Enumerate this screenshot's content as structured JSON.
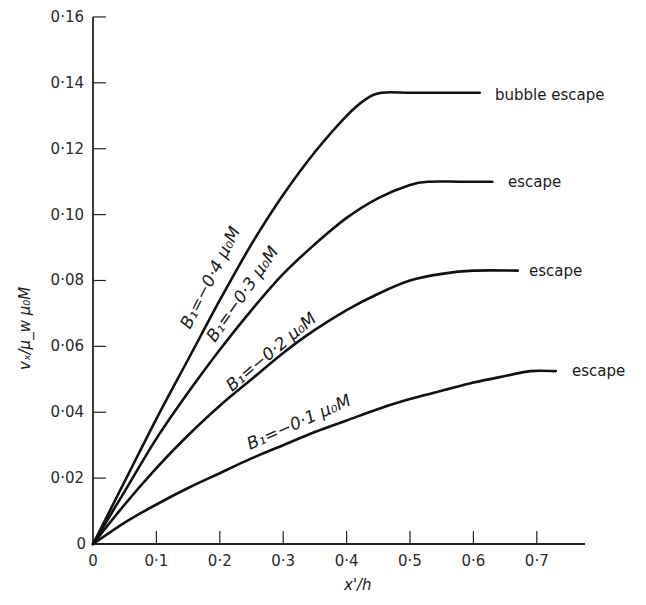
{
  "chart_data": {
    "type": "line",
    "title": "",
    "xlabel": "x'/h",
    "ylabel": "v_x / μ_w μ_0 M",
    "xlim": [
      0,
      0.75
    ],
    "ylim": [
      0,
      0.16
    ],
    "grid": false,
    "legend": "inline labels along curves",
    "x_ticks": [
      "0",
      "0·1",
      "0·2",
      "0·3",
      "0·4",
      "0·5",
      "0·6",
      "0·7"
    ],
    "x_tick_values": [
      0,
      0.1,
      0.2,
      0.3,
      0.4,
      0.5,
      0.6,
      0.7
    ],
    "y_ticks": [
      "0",
      "0·02",
      "0·04",
      "0·06",
      "0·08",
      "0·10",
      "0·12",
      "0·14",
      "0·16"
    ],
    "y_tick_values": [
      0,
      0.02,
      0.04,
      0.06,
      0.08,
      0.1,
      0.12,
      0.14,
      0.16
    ],
    "series": [
      {
        "name": "B1 = -0.4 μ0 M",
        "label": "B₁=−0·4 μ₀M",
        "end_label": "bubble escape",
        "x": [
          0,
          0.05,
          0.1,
          0.15,
          0.2,
          0.25,
          0.3,
          0.35,
          0.4,
          0.43,
          0.455,
          0.5,
          0.55,
          0.61
        ],
        "y": [
          0,
          0.019,
          0.038,
          0.056,
          0.074,
          0.091,
          0.106,
          0.119,
          0.13,
          0.135,
          0.137,
          0.137,
          0.137,
          0.137
        ]
      },
      {
        "name": "B1 = -0.3 μ0 M",
        "label": "B₁=−0·3 μ₀M",
        "end_label": "escape",
        "x": [
          0,
          0.05,
          0.1,
          0.15,
          0.2,
          0.25,
          0.3,
          0.35,
          0.4,
          0.45,
          0.5,
          0.53,
          0.58,
          0.63
        ],
        "y": [
          0,
          0.016,
          0.032,
          0.046,
          0.059,
          0.071,
          0.082,
          0.091,
          0.099,
          0.105,
          0.109,
          0.11,
          0.11,
          0.11
        ]
      },
      {
        "name": "B1 = -0.2 μ0 M",
        "label": "B₁=−0·2 μ₀M",
        "end_label": "escape",
        "x": [
          0,
          0.05,
          0.1,
          0.15,
          0.2,
          0.25,
          0.3,
          0.35,
          0.4,
          0.45,
          0.5,
          0.55,
          0.6,
          0.67
        ],
        "y": [
          0,
          0.012,
          0.023,
          0.033,
          0.042,
          0.05,
          0.058,
          0.065,
          0.071,
          0.076,
          0.08,
          0.082,
          0.083,
          0.083
        ]
      },
      {
        "name": "B1 = -0.1 μ0 M",
        "label": "B₁=−0·1 μ₀M",
        "end_label": "escape",
        "x": [
          0,
          0.05,
          0.1,
          0.15,
          0.2,
          0.25,
          0.3,
          0.35,
          0.4,
          0.45,
          0.5,
          0.55,
          0.6,
          0.65,
          0.69,
          0.73
        ],
        "y": [
          0,
          0.0065,
          0.012,
          0.017,
          0.0215,
          0.026,
          0.03,
          0.034,
          0.0375,
          0.041,
          0.044,
          0.0465,
          0.049,
          0.051,
          0.0525,
          0.0525
        ]
      }
    ]
  },
  "axes": {
    "x_title": "x'/h",
    "y_title": "vₓ/μ_w μ₀M",
    "origin_x_label": "0",
    "origin_y_label": "0"
  }
}
